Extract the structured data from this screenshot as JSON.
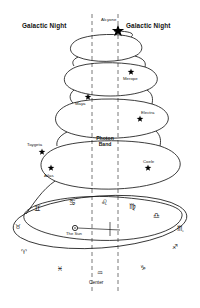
{
  "diagram": {
    "title_left": "Galactic Night",
    "title_right": "Galactic Night",
    "photon_band_line1": "Photon",
    "photon_band_line2": "Band",
    "sun_label": "The Sun",
    "center_label": "Center",
    "stroke_color": "#1a1a1a",
    "star_color": "#000000",
    "dash_color": "#555555",
    "background": "#ffffff"
  },
  "stars": [
    {
      "name": "Alcyone",
      "x": 118,
      "y": 31,
      "label_x": 101,
      "label_y": 18,
      "size": 13
    },
    {
      "name": "Merope",
      "x": 131,
      "y": 72,
      "label_x": 123,
      "label_y": 77,
      "size": 7
    },
    {
      "name": "Maya",
      "x": 88,
      "y": 97,
      "label_x": 75,
      "label_y": 102,
      "size": 7
    },
    {
      "name": "Electra",
      "x": 140,
      "y": 119,
      "label_x": 141,
      "label_y": 111,
      "size": 7
    },
    {
      "name": "Taygeta",
      "x": 42,
      "y": 152,
      "label_x": 27,
      "label_y": 143,
      "size": 7
    },
    {
      "name": "Coele",
      "x": 148,
      "y": 168,
      "label_x": 143,
      "label_y": 160,
      "size": 7
    },
    {
      "name": "Atlas",
      "x": 51,
      "y": 168,
      "label_x": 44,
      "label_y": 174,
      "size": 7
    }
  ],
  "zodiac": [
    {
      "name": "gemini",
      "glyph": "♊",
      "x": 34,
      "y": 205
    },
    {
      "name": "cancer",
      "glyph": "♋",
      "x": 69,
      "y": 199
    },
    {
      "name": "leo",
      "glyph": "♌",
      "x": 101,
      "y": 199
    },
    {
      "name": "virgo",
      "glyph": "♍",
      "x": 129,
      "y": 203
    },
    {
      "name": "libra",
      "glyph": "♎",
      "x": 153,
      "y": 212
    },
    {
      "name": "scorpio",
      "glyph": "♏",
      "x": 177,
      "y": 225
    },
    {
      "name": "taurus",
      "glyph": "♉",
      "x": 15,
      "y": 224
    },
    {
      "name": "sagittarius",
      "glyph": "♐",
      "x": 172,
      "y": 244
    },
    {
      "name": "aries",
      "glyph": "♈",
      "x": 21,
      "y": 249
    },
    {
      "name": "capricorn",
      "glyph": "♑",
      "x": 140,
      "y": 265
    },
    {
      "name": "pisces",
      "glyph": "♓",
      "x": 57,
      "y": 266
    },
    {
      "name": "aquarius",
      "glyph": "♒",
      "x": 97,
      "y": 270
    }
  ],
  "geometry": {
    "dash_left_x": 92,
    "dash_right_x": 118,
    "dash_top_y": 14,
    "dash_bottom_y": 292,
    "sun_x": 75,
    "sun_y": 228
  }
}
